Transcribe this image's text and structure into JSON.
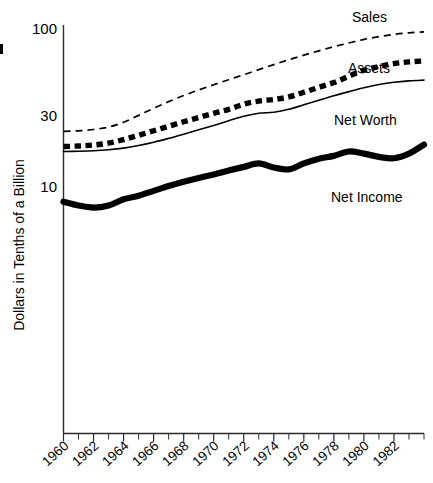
{
  "chart_data": {
    "type": "line",
    "title": "",
    "subtitle": "",
    "xlabel": "",
    "ylabel": "Dollars in Tenths of a Billion",
    "yscale": "log",
    "ylim": [
      2,
      100
    ],
    "xlim": [
      1960,
      1984
    ],
    "grid": false,
    "legend_position": "inline-right",
    "y_ticks": [
      {
        "value": 100,
        "label": "100"
      },
      {
        "value": 30,
        "label": "30"
      },
      {
        "value": 10,
        "label": "10"
      }
    ],
    "x_ticks_major": [
      "1960",
      "1962",
      "1964",
      "1966",
      "1968",
      "1970",
      "1972",
      "1974",
      "1976",
      "1978",
      "1980",
      "1982"
    ],
    "x_ticks_minor": [
      "1961",
      "1963",
      "1965",
      "1967",
      "1969",
      "1971",
      "1973",
      "1975",
      "1977",
      "1979",
      "1981",
      "1983"
    ],
    "x": [
      1960,
      1961,
      1962,
      1963,
      1964,
      1965,
      1966,
      1967,
      1968,
      1969,
      1970,
      1971,
      1972,
      1973,
      1974,
      1975,
      1976,
      1977,
      1978,
      1979,
      1980,
      1981,
      1982,
      1983,
      1984
    ],
    "series": [
      {
        "name": "Sales",
        "style": "thin-dashed",
        "label": "Sales",
        "values": [
          5.2,
          5.3,
          5.5,
          5.9,
          6.8,
          8.3,
          10.2,
          12.4,
          14.8,
          17.4,
          20.3,
          23.5,
          27.2,
          31.5,
          36.5,
          42.0,
          48.0,
          54.5,
          61.5,
          68.5,
          76.0,
          82.5,
          88.0,
          92.0,
          94.5
        ]
      },
      {
        "name": "Assets",
        "style": "thick-dotted",
        "label": "Assets",
        "values": [
          3.35,
          3.4,
          3.5,
          3.7,
          4.1,
          4.65,
          5.3,
          6.05,
          6.9,
          7.8,
          8.8,
          9.9,
          11.5,
          12.6,
          13.2,
          14.2,
          16.3,
          18.8,
          21.6,
          26.0,
          31.0,
          34.5,
          37.5,
          39.5,
          40.5
        ]
      },
      {
        "name": "Net Worth",
        "style": "thin-solid",
        "label": "Net Worth",
        "values": [
          2.9,
          2.92,
          2.96,
          3.05,
          3.2,
          3.45,
          3.8,
          4.25,
          4.8,
          5.45,
          6.2,
          7.1,
          8.1,
          8.85,
          9.1,
          9.9,
          11.3,
          12.9,
          14.7,
          16.6,
          18.6,
          20.4,
          21.8,
          22.7,
          23.2
        ]
      },
      {
        "name": "Net Income",
        "style": "thick-solid",
        "label": "Net Income",
        "values": [
          0.67,
          0.6,
          0.565,
          0.6,
          0.72,
          0.8,
          0.92,
          1.06,
          1.2,
          1.34,
          1.48,
          1.66,
          1.85,
          2.05,
          1.82,
          1.72,
          2.05,
          2.35,
          2.55,
          2.9,
          2.72,
          2.48,
          2.38,
          2.72,
          3.55
        ]
      }
    ]
  },
  "axis": {
    "y_title": "Dollars in Tenths of a Billion"
  },
  "labels": {
    "sales": "Sales",
    "assets": "Assets",
    "net_worth": "Net Worth",
    "net_income": "Net Income"
  }
}
